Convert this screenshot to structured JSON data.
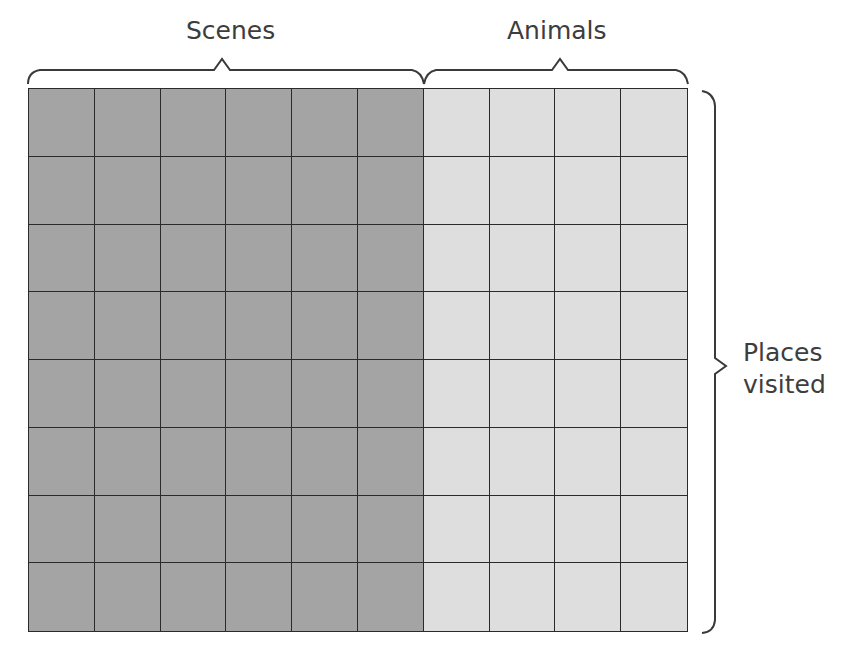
{
  "labels": {
    "top_left": "Scenes",
    "top_right": "Animals",
    "right_line1": "Places",
    "right_line2": "visited"
  },
  "grid": {
    "rows": 8,
    "columns": 10,
    "groups": [
      {
        "name": "Scenes",
        "columns": 6,
        "color": "#a4a4a4"
      },
      {
        "name": "Animals",
        "columns": 4,
        "color": "#dedede"
      }
    ],
    "grid_line_color": "#2a2a2a"
  }
}
